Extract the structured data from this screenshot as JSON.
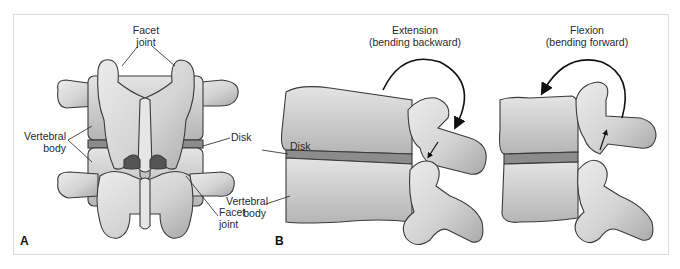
{
  "figure": {
    "panels": [
      {
        "id": "A",
        "letter": "A",
        "view": "posterior",
        "labels": {
          "facet_top_line1": "Facet",
          "facet_top_line2": "joint",
          "vertebral_line1": "Vertebral",
          "vertebral_line2": "body",
          "disk": "Disk",
          "facet_bottom_line1": "Facet",
          "facet_bottom_line2": "joint"
        }
      },
      {
        "id": "B",
        "letter": "B",
        "view": "lateral",
        "labels": {
          "disk": "Disk",
          "vertebral_line1": "Vertebral",
          "vertebral_line2": "body"
        },
        "motions": [
          {
            "title": "Extension",
            "subtitle": "(bending backward)"
          },
          {
            "title": "Flexion",
            "subtitle": "(bending forward)"
          }
        ]
      }
    ],
    "colors": {
      "bone_fill": "#d9d9d9",
      "bone_shadow": "#a8a8a8",
      "outline": "#3a3a3a",
      "disk": "#8c8c8c",
      "frame_border": "#dcdcdc",
      "text": "#2a2a2a"
    }
  }
}
